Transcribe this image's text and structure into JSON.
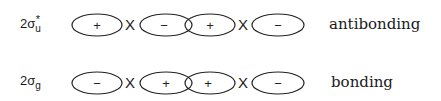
{
  "rows": [
    {
      "orbital_prefix": "2",
      "orbital_symbol": "σ",
      "orbital_subscript": "u",
      "orbital_superscript": "*",
      "lobes": [
        "+",
        "−",
        "+",
        "−"
      ],
      "operator": "X",
      "description": "antibonding"
    },
    {
      "orbital_prefix": "2",
      "orbital_symbol": "σ",
      "orbital_subscript": "g",
      "orbital_superscript": "",
      "lobes": [
        "−",
        "+",
        "+",
        "−"
      ],
      "operator": "X",
      "description": "bonding"
    }
  ]
}
